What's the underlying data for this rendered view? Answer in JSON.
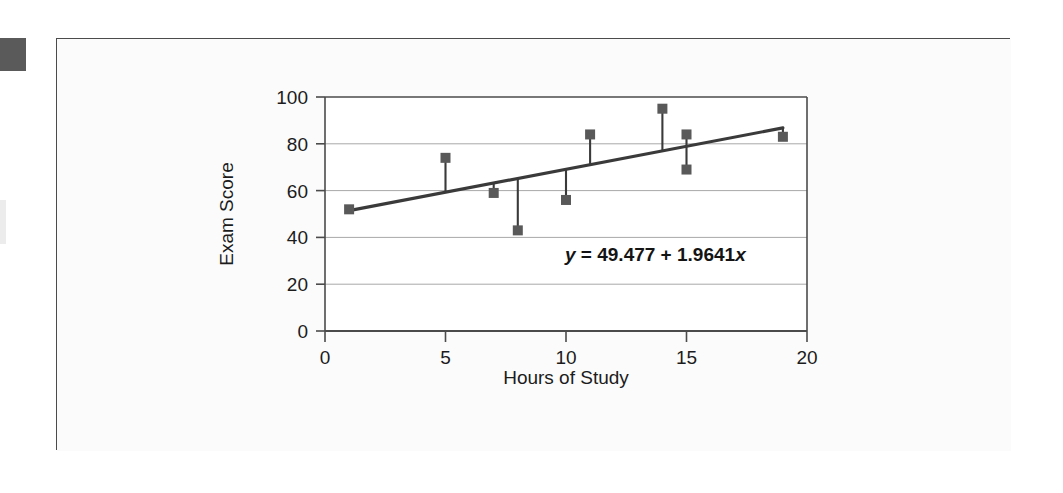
{
  "figure": {
    "name": "scatter-regression-exam-score",
    "equation_label": "y = 49.477 + 1.9641x",
    "equation_parts": {
      "lhs": "y",
      "equals": "=",
      "intercept": "49.477",
      "plus": "+",
      "slope": "1.9641",
      "xvar": "x"
    },
    "colors": {
      "marker": "#595959",
      "regression_line": "#3a3a3a",
      "residual_line": "#3a3a3a",
      "axis": "#4b4b4b",
      "gridline": "#a8a8a8",
      "plot_background": "#ffffff",
      "frame_background": "#fbfbfb",
      "text": "#1c1c1c"
    }
  },
  "chart_data": {
    "type": "scatter",
    "title": "",
    "xlabel": "Hours of Study",
    "ylabel": "Exam Score",
    "xlim": [
      0,
      20
    ],
    "ylim": [
      0,
      100
    ],
    "xticks": [
      0,
      5,
      10,
      15,
      20
    ],
    "xtick_labels": [
      "0",
      "5",
      "10",
      "15",
      "20"
    ],
    "yticks": [
      0,
      20,
      40,
      60,
      80,
      100
    ],
    "ytick_labels": [
      "0",
      "20",
      "40",
      "60",
      "80",
      "100"
    ],
    "grid": "horizontal",
    "legend": "none",
    "annotations": [
      {
        "text": "y = 49.477 + 1.9641x",
        "x": 11.2,
        "y": 32
      }
    ],
    "x": [
      1,
      5,
      7,
      8,
      10,
      11,
      14,
      15,
      15,
      19
    ],
    "y": [
      52,
      74,
      59,
      43,
      56,
      84,
      95,
      84,
      69,
      83
    ],
    "series": [
      {
        "name": "Observed exam scores",
        "marker": "square",
        "values": [
          52,
          74,
          59,
          43,
          56,
          84,
          95,
          84,
          69,
          83
        ]
      }
    ],
    "regression": {
      "name": "Least-squares regression line",
      "intercept": 49.477,
      "slope": 1.9641,
      "equation": "y = 49.477 + 1.9641x",
      "x_start": 1,
      "x_end": 19,
      "y_start": 51.44,
      "y_end": 86.8
    },
    "residual_segments": [
      {
        "x": 1,
        "y_point": 52,
        "y_fit": 51.44
      },
      {
        "x": 5,
        "y_point": 74,
        "y_fit": 59.3
      },
      {
        "x": 7,
        "y_point": 59,
        "y_fit": 63.23
      },
      {
        "x": 8,
        "y_point": 43,
        "y_fit": 65.19
      },
      {
        "x": 10,
        "y_point": 56,
        "y_fit": 69.12
      },
      {
        "x": 11,
        "y_point": 84,
        "y_fit": 71.08
      },
      {
        "x": 14,
        "y_point": 95,
        "y_fit": 76.97
      },
      {
        "x": 15,
        "y_point": 84,
        "y_fit": 78.94
      },
      {
        "x": 15,
        "y_point": 69,
        "y_fit": 78.94
      },
      {
        "x": 19,
        "y_point": 83,
        "y_fit": 86.8
      }
    ]
  }
}
